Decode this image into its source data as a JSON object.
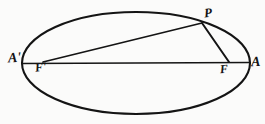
{
  "figure": {
    "kind": "geometry-diagram",
    "background_color": "#fbfbfa",
    "ink_color": "#141414",
    "ellipse": {
      "center_x": 136,
      "center_y": 63,
      "radius_x": 114,
      "radius_y": 51,
      "stroke_width": 2.1
    },
    "major_axis": {
      "x1": 22,
      "y1": 63,
      "x2": 250,
      "y2": 63,
      "stroke_width": 1.6
    },
    "point_p": {
      "x": 202,
      "y": 23
    },
    "focus_left": {
      "x": 44,
      "y": 62
    },
    "focus_right": {
      "x": 228,
      "y": 62
    },
    "segments": [
      {
        "name": "radius-p-to-left-focus",
        "x1": 202,
        "y1": 23,
        "x2": 43,
        "y2": 62,
        "stroke_width": 1.7
      },
      {
        "name": "radius-p-to-right-focus",
        "x1": 202,
        "y1": 23,
        "x2": 229,
        "y2": 62,
        "stroke_width": 1.9
      }
    ],
    "labels": {
      "vertex_left": "A'",
      "vertex_right": "A",
      "focus_left": "F'",
      "focus_right": "F",
      "point_on_curve": "P"
    }
  }
}
